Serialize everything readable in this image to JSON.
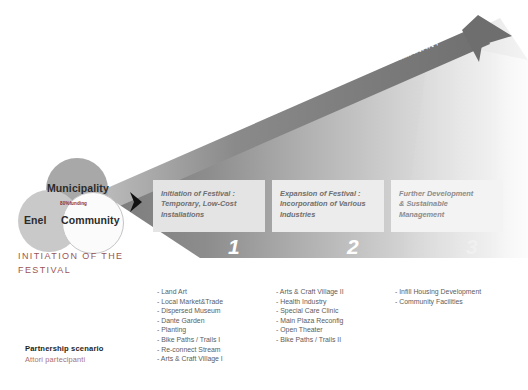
{
  "diagram": {
    "title_legend": {
      "title": "Partnership scenario",
      "subtitle": "Attori partecipanti"
    },
    "axis": {
      "start_label": "TEMPORARY",
      "end_label": "PERMANANT"
    },
    "venn": {
      "circles": [
        {
          "name": "municipality",
          "label": "Municipality",
          "color": "#a8a8a8"
        },
        {
          "name": "enel",
          "label": "Enel",
          "color": "#c9c9c9"
        },
        {
          "name": "community",
          "label": "Community",
          "color": "#fbfbfb"
        }
      ],
      "overlap_note": "80%funding",
      "caption_line1": "Initiation of the",
      "caption_line2": "Festival"
    },
    "phases": [
      {
        "number": "1",
        "title_line1": "Initiation of Festival :",
        "title_line2": "Temporary, Low-Cost",
        "title_line3": "Installations",
        "items": [
          "- Land Art",
          "- Local Market&Trade",
          "- Dispersed Museum",
          "- Dante Garden",
          "- Planting",
          "- Bike Paths / Trails I",
          "- Re-connect Stream",
          "- Arts & Craft Village I"
        ]
      },
      {
        "number": "2",
        "title_line1": "Expansion of Festival :",
        "title_line2": "Incorporation of Various",
        "title_line3": "Industries",
        "items": [
          "- Arts & Craft Village II",
          "- Health Industry",
          "- Special Care Clinic",
          "- Main Plaza Reconfig",
          "- Open Theater",
          "- Bike Paths / Trails II"
        ]
      },
      {
        "number": "3",
        "title_line1": "Further Development",
        "title_line2": "& Sustainable Management",
        "title_line3": "",
        "items": [
          "- Infill Housing Development",
          "- Community Facilities"
        ]
      }
    ],
    "colors": {
      "wedge_dark": "#808080",
      "wedge_light": "#f2f2f2",
      "accent_red": "#9b5555",
      "chevron": "#111111"
    }
  }
}
